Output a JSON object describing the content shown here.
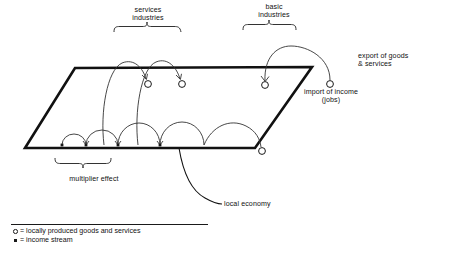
{
  "diagram": {
    "labels": {
      "services_industries": "services\nindustries",
      "basic_industries": "basic\nindustries",
      "export_goods_services": "export of goods\n& services",
      "import_of_income": "import of income\n(jobs)",
      "multiplier_effect": "multiplier effect",
      "local_economy": "local economy"
    },
    "legend": {
      "items": [
        {
          "symbol": "circle",
          "text": "= locally produced goods and services"
        },
        {
          "symbol": "square",
          "text": "= income stream"
        }
      ]
    },
    "colors": {
      "ink": "#1a1a1a",
      "line": "#222222",
      "background": "#ffffff"
    }
  }
}
